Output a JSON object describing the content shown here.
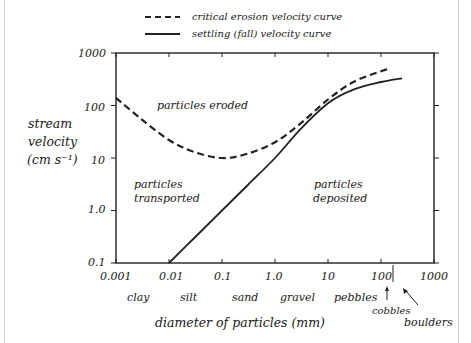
{
  "chart_data": {
    "type": "line",
    "title": "",
    "xlabel": "diameter of particles (mm)",
    "ylabel": "stream velocity (cm s⁻¹)",
    "xscale": "log",
    "yscale": "log",
    "xlim": [
      0.001,
      1000
    ],
    "ylim": [
      0.1,
      1000
    ],
    "grid": false,
    "legend_position": "top-center",
    "x_ticks": [
      "0.001",
      "0.01",
      "0.1",
      "1.0",
      "10",
      "100",
      "1000"
    ],
    "y_ticks": [
      "0.1",
      "1.0",
      "10",
      "100",
      "1000"
    ],
    "series": [
      {
        "name": "critical erosion velocity curve",
        "style": "dashed",
        "x": [
          0.001,
          0.003,
          0.01,
          0.03,
          0.1,
          0.3,
          1,
          3,
          10,
          30,
          100,
          150
        ],
        "y": [
          140,
          55,
          22,
          13,
          10,
          12,
          20,
          45,
          130,
          280,
          450,
          500
        ]
      },
      {
        "name": "settling (fall) velocity curve",
        "style": "solid",
        "x": [
          0.01,
          0.03,
          0.1,
          0.3,
          1,
          3,
          10,
          30,
          100,
          250
        ],
        "y": [
          0.1,
          0.3,
          1.0,
          3,
          10,
          35,
          110,
          200,
          280,
          330
        ]
      }
    ],
    "annotations": [
      {
        "text": "particles eroded",
        "x": 0.03,
        "y": 100
      },
      {
        "text": "particles transported",
        "x": 0.0015,
        "y": 3
      },
      {
        "text": "particles deposited",
        "x": 20,
        "y": 4
      }
    ],
    "size_classes": [
      "clay",
      "silt",
      "sand",
      "gravel",
      "pebbles",
      "cobbles",
      "boulders"
    ]
  },
  "legend": {
    "dashed": "critical erosion velocity curve",
    "solid": "settling (fall) velocity curve"
  },
  "yaxis": {
    "line1": "stream",
    "line2": "velocity",
    "line3": "(cm s⁻¹)"
  },
  "regions": {
    "eroded": "particles eroded",
    "transported1": "particles",
    "transported2": "transported",
    "deposited1": "particles",
    "deposited2": "deposited"
  },
  "classes": {
    "clay": "clay",
    "silt": "silt",
    "sand": "sand",
    "gravel": "gravel",
    "pebbles": "pebbles",
    "cobbles": "cobbles",
    "boulders": "boulders"
  }
}
